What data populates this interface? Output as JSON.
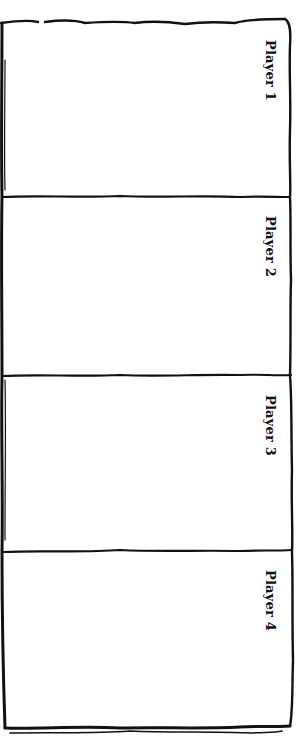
{
  "board": {
    "stroke_color": "#111111",
    "background": "#ffffff",
    "players": [
      {
        "label": "Player 1"
      },
      {
        "label": "Player 2"
      },
      {
        "label": "Player 3"
      },
      {
        "label": "Player 4"
      }
    ]
  }
}
